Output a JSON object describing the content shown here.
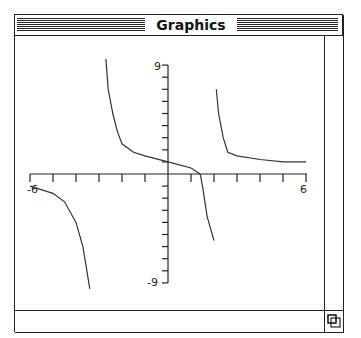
{
  "window": {
    "title": "Graphics"
  },
  "plot": {
    "x_min_label": "-6",
    "x_max_label": "6",
    "y_max_label": "9",
    "y_min_label": "-9"
  },
  "icons": {
    "grow_box": "resize-icon"
  },
  "chart_data": {
    "type": "line",
    "title": "",
    "xlabel": "",
    "ylabel": "",
    "xlim": [
      -6,
      6
    ],
    "ylim": [
      -9,
      9
    ],
    "x_ticks": [
      -6,
      -5,
      -4,
      -3,
      -2,
      -1,
      0,
      1,
      2,
      3,
      4,
      5,
      6
    ],
    "y_ticks": [
      -9,
      -8,
      -7,
      -6,
      -5,
      -4,
      -3,
      -2,
      -1,
      0,
      1,
      2,
      3,
      4,
      5,
      6,
      7,
      8,
      9
    ],
    "tick_labels": {
      "x": [
        "-6",
        "6"
      ],
      "y": [
        "9",
        "-9"
      ]
    },
    "grid": false,
    "legend": null,
    "series": [
      {
        "name": "branch-1",
        "x": [
          -6.0,
          -5.0,
          -4.5,
          -4.0,
          -3.7,
          -3.4
        ],
        "y": [
          -1.0,
          -1.6,
          -2.3,
          -4.0,
          -6.0,
          -9.5
        ]
      },
      {
        "name": "branch-2",
        "x": [
          -2.7,
          -2.6,
          -2.4,
          -2.2,
          -2.0,
          -1.5,
          -1.0,
          0.0,
          1.0,
          1.4
        ],
        "y": [
          9.5,
          7.0,
          5.0,
          3.5,
          2.5,
          1.8,
          1.5,
          1.0,
          0.5,
          0.0
        ]
      },
      {
        "name": "branch-3",
        "x": [
          1.4,
          1.5,
          1.7,
          2.0
        ],
        "y": [
          0.0,
          -1.0,
          -3.5,
          -5.5
        ]
      },
      {
        "name": "branch-4",
        "x": [
          2.1,
          2.2,
          2.4,
          2.6,
          3.0,
          4.0,
          5.0,
          6.0
        ],
        "y": [
          7.0,
          5.0,
          3.0,
          1.8,
          1.5,
          1.2,
          1.0,
          1.0
        ]
      }
    ]
  }
}
